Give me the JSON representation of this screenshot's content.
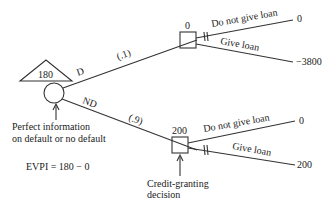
{
  "root": {
    "value": "180",
    "caption_line1": "Perfect information",
    "caption_line2": "on default or no default"
  },
  "branches": {
    "default": {
      "label": "D",
      "prob": "(.1)"
    },
    "no_default": {
      "label": "ND",
      "prob": "(.9)"
    }
  },
  "decision_top": {
    "value": "0",
    "options": [
      {
        "label": "Do not give loan",
        "payoff": "0"
      },
      {
        "label": "Give loan",
        "payoff": "−3800"
      }
    ]
  },
  "decision_bottom": {
    "value": "200",
    "caption_line1": "Credit-granting",
    "caption_line2": "decision",
    "options": [
      {
        "label": "Do not give loan",
        "payoff": "0"
      },
      {
        "label": "Give loan",
        "payoff": "200"
      }
    ]
  },
  "evpi": "EVPI = 180 − 0"
}
